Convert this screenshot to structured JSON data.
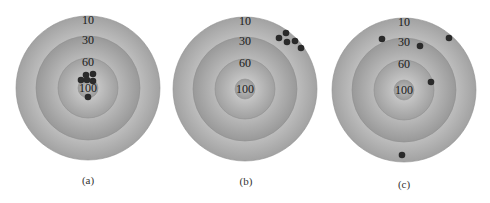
{
  "figure": {
    "ring_scores": [
      "10",
      "30",
      "60",
      "100"
    ],
    "ring_radii": [
      72,
      52,
      30,
      10
    ],
    "colors": {
      "ring_outer": "#b4b4b4",
      "ring_edge": "#8e8e8e",
      "dot": "#2a2a2a",
      "label": "#1a1a1a"
    },
    "targets": [
      {
        "id": "a",
        "caption": "(a)",
        "center": [
          88,
          88
        ],
        "caption_pos": [
          88,
          181
        ],
        "hits": [
          [
            86,
            75
          ],
          [
            93,
            74
          ],
          [
            81,
            80
          ],
          [
            87,
            80
          ],
          [
            93,
            81
          ],
          [
            88,
            97
          ]
        ]
      },
      {
        "id": "b",
        "caption": "(b)",
        "center": [
          245,
          89
        ],
        "caption_pos": [
          246,
          182
        ],
        "hits": [
          [
            286,
            33
          ],
          [
            279,
            38
          ],
          [
            287,
            42
          ],
          [
            295,
            41
          ],
          [
            301,
            48
          ]
        ]
      },
      {
        "id": "c",
        "caption": "(c)",
        "center": [
          404,
          90
        ],
        "caption_pos": [
          404,
          185
        ],
        "hits": [
          [
            382,
            39
          ],
          [
            420,
            46
          ],
          [
            449,
            38
          ],
          [
            431,
            82
          ],
          [
            402,
            155
          ]
        ]
      }
    ]
  }
}
